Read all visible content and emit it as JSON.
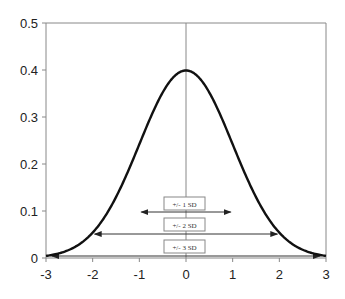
{
  "chart_data": {
    "type": "line",
    "title": "",
    "xlabel": "",
    "ylabel": "",
    "xlim": [
      -3,
      3
    ],
    "ylim": [
      0,
      0.5
    ],
    "grid": false,
    "legend": null,
    "x_ticks": [
      "-3",
      "-2",
      "-1",
      "0",
      "1",
      "2",
      "3"
    ],
    "y_ticks": [
      "0",
      "0.1",
      "0.2",
      "0.3",
      "0.4",
      "0.5"
    ],
    "series": [
      {
        "name": "Standard normal density",
        "x": [
          -3,
          -2.5,
          -2,
          -1.5,
          -1,
          -0.5,
          0,
          0.5,
          1,
          1.5,
          2,
          2.5,
          3
        ],
        "values": [
          0.004,
          0.018,
          0.054,
          0.13,
          0.242,
          0.352,
          0.399,
          0.352,
          0.242,
          0.13,
          0.054,
          0.018,
          0.004
        ]
      }
    ],
    "annotations": [
      {
        "label": "+/- 1 SD",
        "from": -1,
        "to": 1
      },
      {
        "label": "+/- 2 SD",
        "from": -2,
        "to": 2
      },
      {
        "label": "+/- 3 SD",
        "from": -3,
        "to": 3
      }
    ],
    "reference_line": {
      "x": 0,
      "orientation": "vertical"
    }
  },
  "colors": {
    "curve": "#111111",
    "axis": "#888888",
    "arrow": "#333333",
    "box_border": "#888888"
  }
}
